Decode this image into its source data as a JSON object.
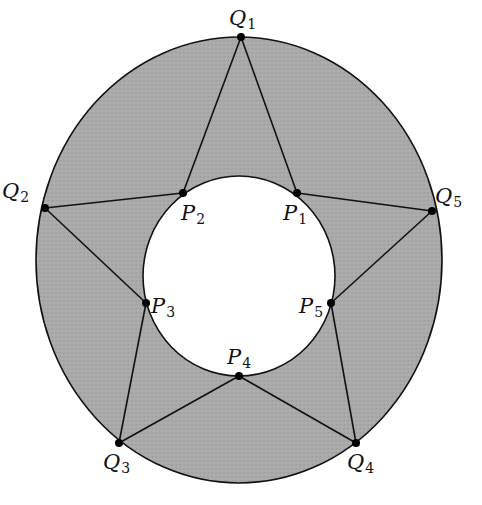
{
  "diagram": {
    "colors": {
      "annulus_fill": "#a9a9a9",
      "inner_fill": "#ffffff",
      "stroke": "#111111",
      "point": "#000000"
    },
    "outer_circle": {
      "cx": 239,
      "cy": 260,
      "rx": 203,
      "ry": 223
    },
    "inner_circle": {
      "cx": 239,
      "cy": 276,
      "rx": 96,
      "ry": 100
    },
    "outer_points": [
      {
        "id": "Q1",
        "name": "Q",
        "sub": "1",
        "x": 241,
        "y": 37,
        "lx": 229,
        "ly": 8
      },
      {
        "id": "Q2",
        "name": "Q",
        "sub": "2",
        "x": 45,
        "y": 208,
        "lx": 2,
        "ly": 181
      },
      {
        "id": "Q3",
        "name": "Q",
        "sub": "3",
        "x": 119,
        "y": 443,
        "lx": 103,
        "ly": 452
      },
      {
        "id": "Q4",
        "name": "Q",
        "sub": "4",
        "x": 356,
        "y": 443,
        "lx": 347,
        "ly": 452
      },
      {
        "id": "Q5",
        "name": "Q",
        "sub": "5",
        "x": 432,
        "y": 211,
        "lx": 435,
        "ly": 186
      }
    ],
    "inner_points": [
      {
        "id": "P1",
        "name": "P",
        "sub": "1",
        "x": 297,
        "y": 193,
        "lx": 283,
        "ly": 203
      },
      {
        "id": "P2",
        "name": "P",
        "sub": "2",
        "x": 183,
        "y": 193,
        "lx": 181,
        "ly": 203
      },
      {
        "id": "P3",
        "name": "P",
        "sub": "3",
        "x": 146,
        "y": 303,
        "lx": 151,
        "ly": 296
      },
      {
        "id": "P4",
        "name": "P",
        "sub": "4",
        "x": 239,
        "y": 376,
        "lx": 227,
        "ly": 347
      },
      {
        "id": "P5",
        "name": "P",
        "sub": "5",
        "x": 331,
        "y": 303,
        "lx": 299,
        "ly": 296
      }
    ],
    "edges": [
      [
        "Q1",
        "P1"
      ],
      [
        "P1",
        "Q5"
      ],
      [
        "Q5",
        "P5"
      ],
      [
        "P5",
        "Q4"
      ],
      [
        "Q4",
        "P4"
      ],
      [
        "P4",
        "Q3"
      ],
      [
        "Q3",
        "P3"
      ],
      [
        "P3",
        "Q2"
      ],
      [
        "Q2",
        "P2"
      ],
      [
        "P2",
        "Q1"
      ]
    ]
  }
}
